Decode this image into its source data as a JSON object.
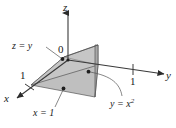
{
  "figure": {
    "kind": "3d-solid-region-diagram",
    "background_color": "#ffffff",
    "line_color": "#3a3a3a",
    "axes": [
      {
        "id": "z",
        "label": "z",
        "direction": "up"
      },
      {
        "id": "y",
        "label": "y",
        "direction": "right"
      },
      {
        "id": "x",
        "label": "x",
        "direction": "lower-left"
      }
    ],
    "origin_label": "0",
    "ticks": [
      {
        "axis": "x",
        "label": "1",
        "value": 1
      },
      {
        "axis": "y",
        "label": "1",
        "value": 1
      }
    ],
    "surface_labels": [
      {
        "id": "plane-z-equals-y",
        "text": "z = y"
      },
      {
        "id": "plane-x-equals-1",
        "text": "x = 1"
      },
      {
        "id": "cylinder-y-equals-x-squared",
        "base": "y = x",
        "exponent": "2"
      }
    ],
    "surfaces": [
      {
        "id": "slanted-plane-z-equals-y",
        "equation": "z = y",
        "fill": "#c2c2c2",
        "stroke": "#4a4a4a"
      },
      {
        "id": "vertical-plane-x-equals-1",
        "equation": "x = 1",
        "fill": "#ababab",
        "stroke": "#4a4a4a"
      },
      {
        "id": "base-region-y-equals-x-squared",
        "equation": "y = x^2",
        "fill": "#bdbdbd",
        "stroke": "#4a4a4a"
      }
    ]
  }
}
